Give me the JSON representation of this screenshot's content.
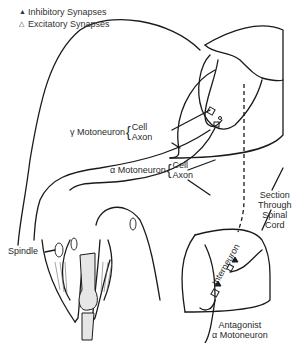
{
  "legend": {
    "items": [
      {
        "symbol": "▲",
        "label": "Inhibitory Synapses"
      },
      {
        "symbol": "△",
        "label": "Excitatory Synapses"
      }
    ]
  },
  "labels": {
    "gamma_motoneuron": {
      "prefix": "γ",
      "name": "Motoneuron",
      "parts": [
        "Cell",
        "Axon"
      ]
    },
    "alpha_motoneuron": {
      "prefix": "α",
      "name": "Motoneuron",
      "parts": [
        "Cell",
        "Axon"
      ]
    },
    "section": [
      "Section",
      "Through",
      "Spinal",
      "Cord"
    ],
    "spindle": "Spindle",
    "interneuron": "Interneuron",
    "antagonist": [
      "Antagonist",
      "α Motoneuron"
    ]
  },
  "colors": {
    "line": "#1a1a1a",
    "bone_fill": "#e6e6e6",
    "text": "#2a2a2a"
  }
}
